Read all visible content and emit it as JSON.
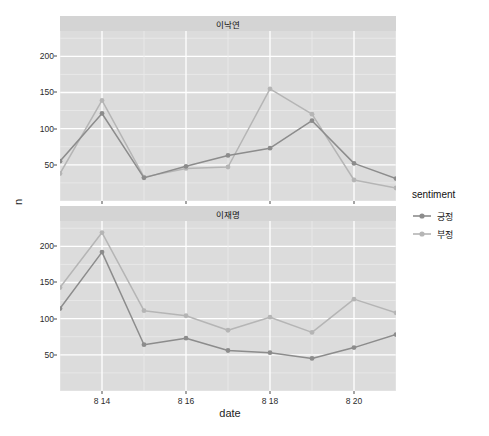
{
  "chart_data": {
    "type": "line",
    "title": "",
    "xlabel": "date",
    "ylabel": "n",
    "ylim": [
      0,
      235
    ],
    "xlim": [
      13,
      21
    ],
    "grid": true,
    "legend_position": "right",
    "legend_title": "sentiment",
    "x_tick_labels": [
      "8 14",
      "8 16",
      "8 18",
      "8 20"
    ],
    "x_tick_values": [
      14,
      16,
      18,
      20
    ],
    "y_tick_labels": [
      "50",
      "100",
      "150",
      "200"
    ],
    "y_tick_values": [
      50,
      100,
      150,
      200
    ],
    "x": [
      13,
      14,
      15,
      16,
      17,
      18,
      19,
      20,
      21
    ],
    "facets": [
      {
        "label": "이낙연",
        "series": [
          {
            "name": "긍정",
            "color": "#8c8c8c",
            "values": [
              55,
              121,
              32,
              48,
              63,
              73,
              111,
              52,
              31
            ]
          },
          {
            "name": "부정",
            "color": "#b5b5b5",
            "values": [
              38,
              139,
              33,
              45,
              47,
              155,
              120,
              29,
              18
            ]
          }
        ]
      },
      {
        "label": "이재명",
        "series": [
          {
            "name": "긍정",
            "color": "#8c8c8c",
            "values": [
              114,
              192,
              64,
              73,
              56,
              53,
              45,
              60,
              78
            ]
          },
          {
            "name": "부정",
            "color": "#b5b5b5",
            "values": [
              143,
              219,
              111,
              104,
              84,
              102,
              81,
              127,
              108
            ]
          }
        ]
      }
    ]
  },
  "legend": {
    "title": "sentiment",
    "items": [
      {
        "label": "긍정",
        "color": "#8c8c8c"
      },
      {
        "label": "부정",
        "color": "#b5b5b5"
      }
    ]
  },
  "axis": {
    "x_title": "date",
    "y_title": "n"
  },
  "panels": {
    "top_strip": "이낙연",
    "bottom_strip": "이재명"
  },
  "theme": {
    "panel_background": "#dcdcdc",
    "strip_background": "#d4d4d4",
    "gridline_major": "#ffffff",
    "gridline_minor": "#ebebeb",
    "text_color": "#1a1a1a"
  }
}
